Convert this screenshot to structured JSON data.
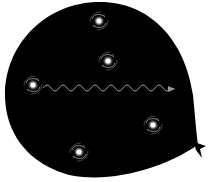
{
  "diagram": {
    "balloon": {
      "fill": "#000000",
      "background": "#ffffff"
    },
    "galaxies": [
      {
        "id": "galaxy-1",
        "cx": 99,
        "cy": 21
      },
      {
        "id": "galaxy-2",
        "cx": 108,
        "cy": 61
      },
      {
        "id": "galaxy-3",
        "cx": 33,
        "cy": 85
      },
      {
        "id": "galaxy-4",
        "cx": 153,
        "cy": 125
      },
      {
        "id": "galaxy-5",
        "cx": 79,
        "cy": 152
      }
    ],
    "light_wave": {
      "start": [
        43,
        88
      ],
      "end": [
        174,
        89
      ],
      "color": "#9a9a9a",
      "cycles": 8
    }
  }
}
